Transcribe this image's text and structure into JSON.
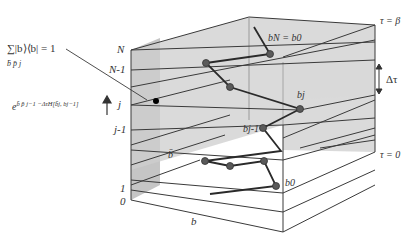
{
  "diagram": {
    "axis_labels": {
      "horizontal": "b",
      "time_slices": [
        "N",
        "N-1",
        "j",
        "j-1",
        "1",
        "0"
      ],
      "tau_top": "τ = β",
      "tau_bottom": "τ = 0",
      "delta_tau": "Δτ"
    },
    "annotations": {
      "completeness_relation": "∑|b⟩⟨b| = 1",
      "completeness_sum_index": "b̄ p̄ j",
      "propagator": "e^{b̄pj−1 −ΔτH[b̄j, bj−1]}",
      "propagator_main": "e",
      "propagator_sup": "b̄ p̄ j−1 −ΔτH[b̄j, bj−1]",
      "path_point_labels": {
        "bN_b0": "bN = b0",
        "bj": "bj",
        "bj_minus_1": "bj-1",
        "bbar": "b̄",
        "b0": "b0"
      }
    },
    "colors": {
      "slab_fill": "#c8c8c8",
      "slab_stroke": "#3a3a3a",
      "path": "#2a2a2a",
      "dot": "#555555",
      "dot_black": "#000000",
      "label": "#333333"
    }
  }
}
